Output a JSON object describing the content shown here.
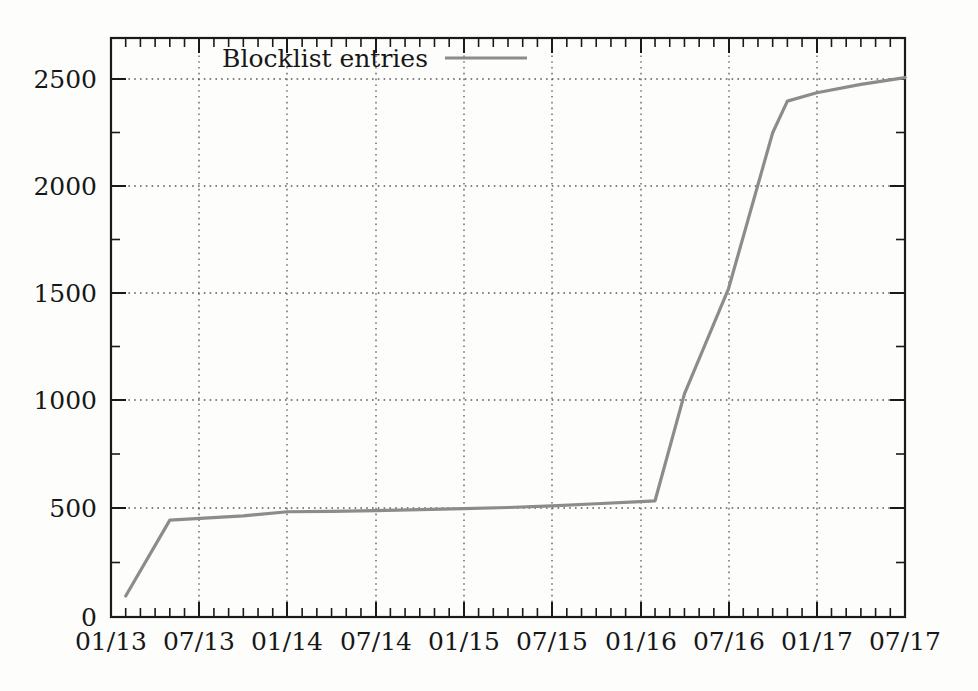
{
  "chart_data": {
    "type": "line",
    "title": "",
    "xlabel": "",
    "ylabel": "",
    "legend_position": "top-center-inside",
    "grid": true,
    "ylim": [
      0,
      2750
    ],
    "xlim": [
      "01/13",
      "07/17"
    ],
    "y_ticks": [
      0,
      500,
      1000,
      1500,
      2000,
      2500
    ],
    "y_tick_labels": [
      "0",
      "500",
      "1000",
      "1500",
      "2000",
      "2500"
    ],
    "x_ticks": [
      "01/13",
      "07/13",
      "01/14",
      "07/14",
      "01/15",
      "07/15",
      "01/16",
      "07/16",
      "01/17",
      "07/17"
    ],
    "x_tick_labels": [
      "01/13",
      "07/13",
      "01/14",
      "07/14",
      "01/15",
      "07/15",
      "01/16",
      "07/16",
      "01/17",
      "07/17"
    ],
    "x_minor_tick_interval_months": 1,
    "series": [
      {
        "name": "Blocklist entries",
        "color": "#8c8c8c",
        "x": [
          "02/13",
          "05/13",
          "10/13",
          "01/14",
          "04/14",
          "07/14",
          "10/14",
          "01/15",
          "04/15",
          "07/15",
          "10/15",
          "01/16",
          "02/16",
          "04/16",
          "07/16",
          "10/16",
          "11/16",
          "01/17",
          "04/17",
          "07/17"
        ],
        "values": [
          100,
          460,
          480,
          500,
          502,
          505,
          510,
          515,
          520,
          528,
          538,
          548,
          552,
          1060,
          1560,
          2300,
          2450,
          2490,
          2530,
          2562
        ]
      }
    ],
    "legend": [
      {
        "label": "Blocklist entries",
        "color": "#8c8c8c"
      }
    ]
  },
  "axes": {
    "y_labels": [
      "2500",
      "2000",
      "1500",
      "1000",
      "500",
      "0"
    ],
    "x_labels": [
      "01/13",
      "07/13",
      "01/14",
      "07/14",
      "01/15",
      "07/15",
      "01/16",
      "07/16",
      "01/17",
      "07/17"
    ]
  },
  "legend": {
    "entry_label": "Blocklist entries",
    "line_color": "#8c8c8c"
  },
  "colors": {
    "series": "#8c8c8c",
    "axis": "#1a1a1a",
    "grid": "#5a5a5a",
    "background": "#fdfdfc",
    "text": "#171717"
  }
}
